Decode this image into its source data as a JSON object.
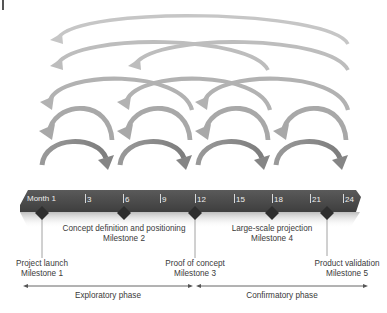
{
  "timeline": {
    "bar_color": "#4a4a4a",
    "tick_text_color": "#eeeeee",
    "ticks": [
      {
        "label": "Month 1",
        "x": 27
      },
      {
        "label": "3",
        "x": 85
      },
      {
        "label": "6",
        "x": 124
      },
      {
        "label": "9",
        "x": 160
      },
      {
        "label": "12",
        "x": 195
      },
      {
        "label": "15",
        "x": 234
      },
      {
        "label": "18",
        "x": 272
      },
      {
        "label": "21",
        "x": 310
      },
      {
        "label": "24",
        "x": 343
      }
    ]
  },
  "milestones": [
    {
      "name": "Project launch",
      "label": "Milestone 1",
      "month": 1,
      "x": 42,
      "position": "below"
    },
    {
      "name": "Concept definition and positioning",
      "label": "Milestone 2",
      "month": 6,
      "x": 124,
      "position": "above"
    },
    {
      "name": "Proof of concept",
      "label": "Milestone 3",
      "month": 12,
      "x": 195,
      "position": "below"
    },
    {
      "name": "Large-scale projection",
      "label": "Milestone 4",
      "month": 18,
      "x": 272,
      "position": "above"
    },
    {
      "name": "Product validation",
      "label": "Milestone 5",
      "month": 23,
      "x": 327,
      "position": "below"
    }
  ],
  "phases": [
    {
      "label": "Exploratory phase",
      "from_x": 24,
      "to_x": 192
    },
    {
      "label": "Confirmatory phase",
      "from_x": 197,
      "to_x": 367
    }
  ],
  "feedback_arcs": {
    "description": "Iteration arrows above the timeline: forward arcs (bottom row) and backward feedback arcs of increasing span",
    "rows": [
      {
        "row": 1,
        "direction": "backward",
        "span_months": 24,
        "count": 1,
        "color": "#c4c4c4"
      },
      {
        "row": 2,
        "direction": "backward",
        "span_months": 18,
        "count": 2,
        "color": "#bdbdbd"
      },
      {
        "row": 3,
        "direction": "backward",
        "span_months": 12,
        "count": 3,
        "color": "#b0b0b0"
      },
      {
        "row": 4,
        "direction": "backward",
        "span_months": 6,
        "count": 4,
        "color": "#a6a6a6"
      },
      {
        "row": 5,
        "direction": "forward",
        "span_months": 6,
        "count": 4,
        "color": "#8a8a8a"
      }
    ]
  }
}
